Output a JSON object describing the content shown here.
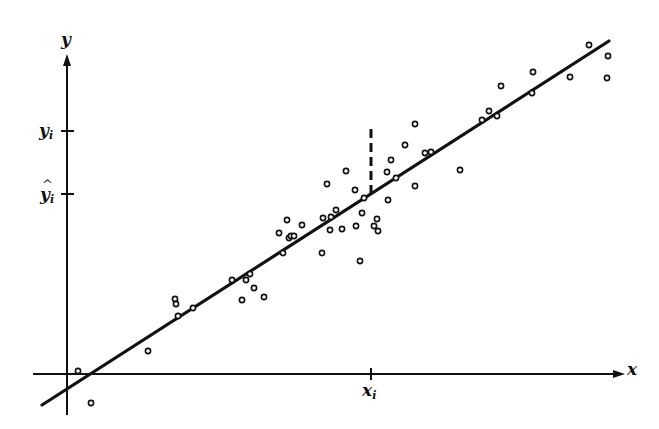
{
  "labels": {
    "y_axis": "y",
    "x_axis": "x",
    "yi_main": "y",
    "yi_sub": "i",
    "yhat_main": "y",
    "yhat_sub": "i",
    "yhat_caret": "^",
    "xi_main": "x",
    "xi_sub": "i"
  },
  "colors": {
    "ink": "#111111",
    "background": "#ffffff"
  },
  "chart_data": {
    "type": "scatter",
    "title": "",
    "xlabel": "x",
    "ylabel": "y",
    "grid": false,
    "legend": null,
    "axes": {
      "origin_px": [
        67,
        374
      ],
      "x_axis_px": [
        33,
        625
      ],
      "y_axis_px": [
        415,
        55
      ],
      "x_ticks": [
        {
          "label": "x_i",
          "px": 371
        }
      ],
      "y_ticks": [
        {
          "label": "y_i",
          "px": 131
        },
        {
          "label": "ŷ_i",
          "px": 194
        }
      ]
    },
    "regression_line_px": [
      [
        42,
        405
      ],
      [
        609,
        41
      ]
    ],
    "residual_segment_px": [
      [
        371,
        129
      ],
      [
        371,
        194
      ]
    ],
    "annotations": [
      "dashed vertical residual from observed y_i down to fitted ŷ_i at x_i"
    ],
    "points_px": [
      [
        78,
        371
      ],
      [
        91,
        403
      ],
      [
        148,
        351
      ],
      [
        175,
        299
      ],
      [
        176,
        304
      ],
      [
        178,
        316
      ],
      [
        193,
        308
      ],
      [
        232,
        280
      ],
      [
        242,
        300
      ],
      [
        246,
        280
      ],
      [
        250,
        274
      ],
      [
        254,
        288
      ],
      [
        264,
        297
      ],
      [
        279,
        233
      ],
      [
        283,
        253
      ],
      [
        287,
        220
      ],
      [
        289,
        238
      ],
      [
        291,
        236
      ],
      [
        294,
        236
      ],
      [
        302,
        225
      ],
      [
        322,
        253
      ],
      [
        323,
        218
      ],
      [
        327,
        184
      ],
      [
        330,
        230
      ],
      [
        331,
        217
      ],
      [
        336,
        210
      ],
      [
        342,
        229
      ],
      [
        346,
        171
      ],
      [
        355,
        190
      ],
      [
        356,
        226
      ],
      [
        360,
        261
      ],
      [
        362,
        213
      ],
      [
        364,
        198
      ],
      [
        374,
        226
      ],
      [
        377,
        219
      ],
      [
        378,
        231
      ],
      [
        387,
        172
      ],
      [
        388,
        200
      ],
      [
        391,
        160
      ],
      [
        396,
        178
      ],
      [
        405,
        145
      ],
      [
        415,
        124
      ],
      [
        415,
        186
      ],
      [
        425,
        153
      ],
      [
        431,
        152
      ],
      [
        460,
        170
      ],
      [
        482,
        120
      ],
      [
        489,
        111
      ],
      [
        497,
        116
      ],
      [
        501,
        86
      ],
      [
        532,
        93
      ],
      [
        533,
        72
      ],
      [
        570,
        77
      ],
      [
        589,
        45
      ],
      [
        608,
        56
      ],
      [
        607,
        78
      ]
    ]
  }
}
